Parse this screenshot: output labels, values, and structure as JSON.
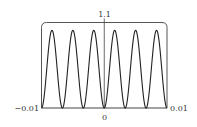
{
  "chart_data": {
    "type": "line",
    "title": "",
    "xlabel": "",
    "ylabel": "",
    "xlim": [
      -0.01,
      0.01
    ],
    "ylim": [
      0,
      1.1
    ],
    "grid": false,
    "legend": null,
    "tick_labels": {
      "x_left": "−0.01",
      "x_center": "0",
      "x_right": "0.01",
      "y_top": "1.1"
    },
    "series": [
      {
        "name": "f(x)",
        "description": "sin^2(300*pi*x), six peaks of height 1 across [-0.01, 0.01], zeros at -0.01, 0 and 0.01",
        "x": [
          -0.01,
          -0.00833,
          -0.00667,
          -0.005,
          -0.00333,
          -0.00167,
          0,
          0.00167,
          0.00333,
          0.005,
          0.00667,
          0.00833,
          0.01
        ],
        "y": [
          0,
          1,
          0,
          1,
          0,
          1,
          0,
          1,
          0,
          1,
          0,
          1,
          0
        ]
      }
    ],
    "frame": {
      "style": "rounded top corners, bottom edge is x-axis"
    }
  },
  "colors": {
    "curve": "#222222",
    "frame": "#555555",
    "axis": "#444444",
    "background": "#ffffff"
  }
}
